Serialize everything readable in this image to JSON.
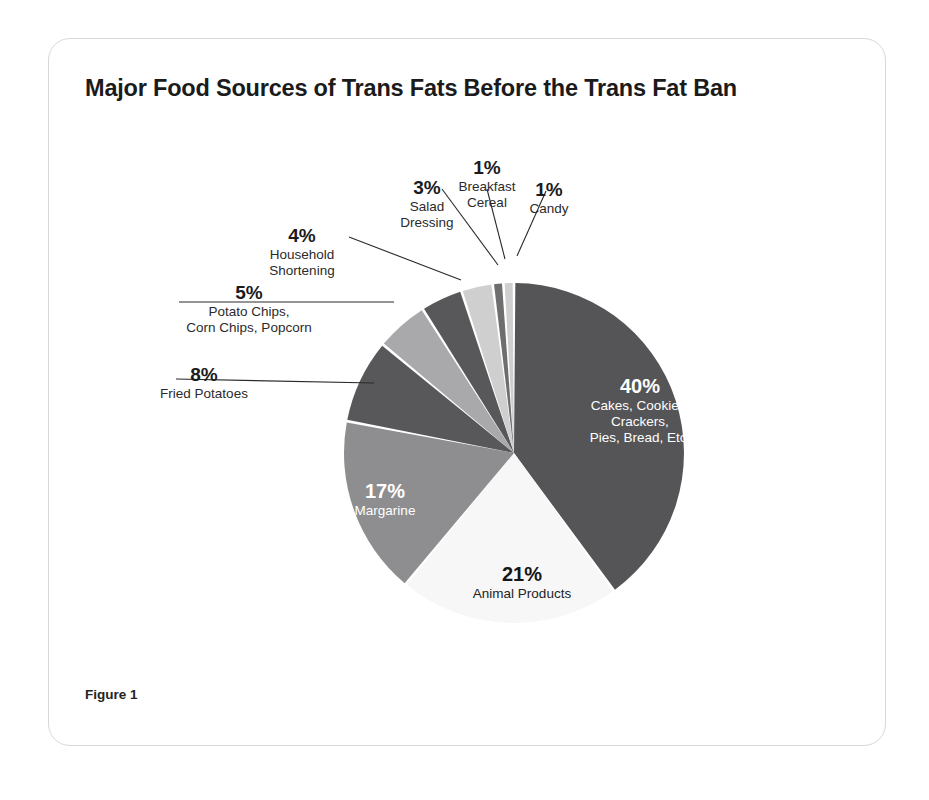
{
  "figure": {
    "title": "Major Food Sources of Trans Fats Before the Trans Fat Ban",
    "caption": "Figure 1"
  },
  "chart_data": {
    "type": "pie",
    "title": "Major Food Sources of Trans Fats Before the Trans Fat Ban",
    "unit": "%",
    "total": 100,
    "start_angle_deg": 0,
    "direction": "clockwise",
    "legend": "none (direct labels)",
    "categories": [
      "Cakes, Cookies, Crackers, Pies, Bread, Etc.",
      "Animal Products",
      "Margarine",
      "Fried Potatoes",
      "Potato Chips, Corn Chips, Popcorn",
      "Household Shortening",
      "Salad Dressing",
      "Breakfast Cereal",
      "Candy"
    ],
    "values": [
      40,
      21,
      17,
      8,
      5,
      4,
      3,
      1,
      1
    ],
    "slices": [
      {
        "label": "Cakes, Cookies, Crackers, Pies, Bread, Etc.",
        "label_lines": [
          "Cakes, Cookies,",
          "Crackers,",
          "Pies, Bread, Etc."
        ],
        "percent": "40%",
        "value": 40,
        "color": "#555558",
        "label_placement": "inside",
        "text_color": "#ffffff"
      },
      {
        "label": "Animal Products",
        "label_lines": [
          "Animal Products"
        ],
        "percent": "21%",
        "value": 21,
        "color": "#f7f7f7",
        "label_placement": "inside",
        "text_color": "#161616"
      },
      {
        "label": "Margarine",
        "label_lines": [
          "Margarine"
        ],
        "percent": "17%",
        "value": 17,
        "color": "#8e8e90",
        "label_placement": "inside",
        "text_color": "#ffffff"
      },
      {
        "label": "Fried Potatoes",
        "label_lines": [
          "Fried Potatoes"
        ],
        "percent": "8%",
        "value": 8,
        "color": "#58585b",
        "label_placement": "outside"
      },
      {
        "label": "Potato Chips, Corn Chips, Popcorn",
        "label_lines": [
          "Potato Chips,",
          "Corn Chips, Popcorn"
        ],
        "percent": "5%",
        "value": 5,
        "color": "#a9a9ab",
        "label_placement": "outside"
      },
      {
        "label": "Household Shortening",
        "label_lines": [
          "Household",
          "Shortening"
        ],
        "percent": "4%",
        "value": 4,
        "color": "#58585b",
        "label_placement": "outside"
      },
      {
        "label": "Salad Dressing",
        "label_lines": [
          "Salad",
          "Dressing"
        ],
        "percent": "3%",
        "value": 3,
        "color": "#cfcfd0",
        "label_placement": "outside"
      },
      {
        "label": "Breakfast Cereal",
        "label_lines": [
          "Breakfast",
          "Cereal"
        ],
        "percent": "1%",
        "value": 1,
        "color": "#6e6e71",
        "label_placement": "outside"
      },
      {
        "label": "Candy",
        "label_lines": [
          "Candy"
        ],
        "percent": "1%",
        "value": 1,
        "color": "#cfcfd0",
        "label_placement": "outside"
      }
    ]
  },
  "callouts": {
    "salad_dressing": {
      "pct": "3%",
      "l1": "Salad",
      "l2": "Dressing"
    },
    "breakfast_cereal": {
      "pct": "1%",
      "l1": "Breakfast",
      "l2": "Cereal"
    },
    "candy": {
      "pct": "1%",
      "l1": "Candy"
    },
    "household_shortening": {
      "pct": "4%",
      "l1": "Household",
      "l2": "Shortening"
    },
    "potato_chips": {
      "pct": "5%",
      "l1": "Potato Chips,",
      "l2": "Corn Chips, Popcorn"
    },
    "fried_potatoes": {
      "pct": "8%",
      "l1": "Fried Potatoes"
    }
  },
  "inslice": {
    "cakes": {
      "pct": "40%",
      "l1": "Cakes, Cookies,",
      "l2": "Crackers,",
      "l3": "Pies, Bread, Etc."
    },
    "animal": {
      "pct": "21%",
      "l1": "Animal Products"
    },
    "margarine": {
      "pct": "17%",
      "l1": "Margarine"
    }
  },
  "colors": {
    "card_border": "#d8d8d8",
    "page_bg": "#ffffff",
    "leader_line": "#2a2a2a",
    "title_color": "#1b1b1b"
  }
}
